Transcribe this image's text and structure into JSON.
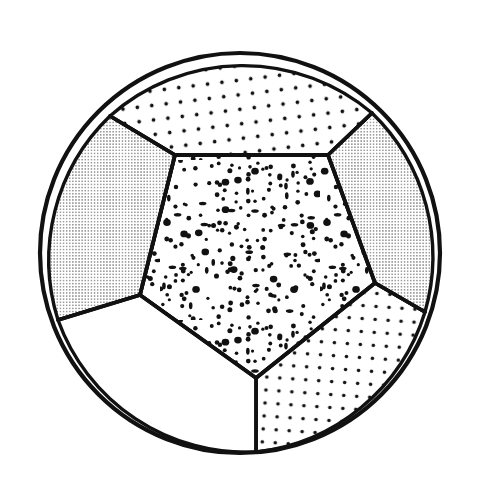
{
  "figure": {
    "kind": "line-drawing",
    "background_color": "#ffffff",
    "ink_color": "#111111",
    "canvas": {
      "width": 477,
      "height": 498
    }
  },
  "sphere": {
    "label": "sphere-outline",
    "center_x": 240,
    "center_y": 253,
    "radius": 200,
    "stroke_width": 4.2,
    "stroke_color": "#111111",
    "fill_color": "#ffffff"
  },
  "textures": [
    {
      "id": "fine-grid",
      "label": "fine dense dot grid",
      "dot_radius": 0.62,
      "spacing": 3.1,
      "rotation_deg": 0,
      "dot_color": "#1a1a1a"
    },
    {
      "id": "medium-grid-top",
      "label": "medium regular dot grid",
      "dot_radius": 1.85,
      "spacing": 14.5,
      "rotation_deg": -7,
      "dot_color": "#111111"
    },
    {
      "id": "medium-grid-bottom",
      "label": "medium regular dot grid",
      "dot_radius": 1.8,
      "spacing": 13.0,
      "rotation_deg": 4,
      "dot_color": "#111111"
    },
    {
      "id": "random-coarse",
      "label": "random scattered coarse stipple",
      "dot_radius": 2.0,
      "spacing": 8.0,
      "rotation_deg": 0,
      "dot_color": "#111111"
    },
    {
      "id": "blank",
      "label": "no stipple",
      "dot_radius": 0,
      "spacing": 0,
      "rotation_deg": 0,
      "dot_color": "none"
    }
  ],
  "faces": [
    {
      "id": "top-face",
      "name": "top hexagonal face",
      "texture": "medium-grid-top",
      "shading": "medium",
      "outline": "M 110,116 L 175,155 L 328,155 L 372,113 A 200,200 0 0 0 110,116 Z",
      "stroke_width": 3.4
    },
    {
      "id": "left-face",
      "name": "upper-left face",
      "texture": "fine-grid",
      "shading": "dense",
      "outline": "M 110,116 A 200,200 0 0 0 58,320 L 140,295 L 175,155 Z",
      "stroke_width": 3.4
    },
    {
      "id": "right-face",
      "name": "upper-right face",
      "texture": "fine-grid",
      "shading": "dense",
      "outline": "M 372,113 L 328,155 L 375,283 L 425,312 A 200,200 0 0 0 372,113 Z",
      "stroke_width": 3.4
    },
    {
      "id": "center-face",
      "name": "central pentagonal face",
      "texture": "random-coarse",
      "shading": "scattered",
      "outline": "M 175,155 L 328,155 L 375,283 L 256,378 L 140,295 Z",
      "stroke_width": 3.8
    },
    {
      "id": "bottom-right-face",
      "name": "lower-right face",
      "texture": "medium-grid-bottom",
      "shading": "medium",
      "outline": "M 375,283 L 425,312 A 200,200 0 0 1 256,452 L 256,378 Z",
      "stroke_width": 3.4
    },
    {
      "id": "bottom-left-face",
      "name": "lower-left blank face",
      "texture": "blank",
      "shading": "none",
      "outline": "M 58,320 L 140,295 L 256,378 L 256,452 A 200,200 0 0 1 58,320 Z",
      "stroke_width": 3.4
    }
  ],
  "edges": [
    {
      "id": "edge-top-left",
      "name": "edge between top and left face",
      "path": "M 110,116 L 175,155",
      "width": 3.6
    },
    {
      "id": "edge-top-center",
      "name": "edge between top and center face",
      "path": "M 175,155 L 328,155",
      "width": 3.6
    },
    {
      "id": "edge-top-right",
      "name": "edge between top and right face",
      "path": "M 328,155 L 372,113",
      "width": 3.6
    },
    {
      "id": "edge-left-center",
      "name": "edge between left and center face",
      "path": "M 175,155 L 140,295",
      "width": 3.6
    },
    {
      "id": "edge-left-bottomleft",
      "name": "edge between left and lower-left face",
      "path": "M 140,295 L 58,320",
      "width": 3.6
    },
    {
      "id": "edge-right-center",
      "name": "edge between right and center face",
      "path": "M 328,155 L 375,283",
      "width": 3.6
    },
    {
      "id": "edge-right-bottomright",
      "name": "edge between right and lower-right face",
      "path": "M 375,283 L 425,312",
      "width": 3.6
    },
    {
      "id": "edge-center-bottomleft",
      "name": "edge between center and lower-left face",
      "path": "M 140,295 L 256,378",
      "width": 3.6
    },
    {
      "id": "edge-center-bottomright",
      "name": "edge between center and lower-right face",
      "path": "M 375,283 L 256,378",
      "width": 3.6
    },
    {
      "id": "edge-bottom-vertical",
      "name": "edge between lower-left and lower-right face",
      "path": "M 256,378 L 256,452",
      "width": 3.6
    }
  ],
  "vertices": [
    {
      "id": "v-top-left-rim",
      "name": "top-left rim vertex",
      "x": 110,
      "y": 116
    },
    {
      "id": "v-top-right-rim",
      "name": "top-right rim vertex",
      "x": 372,
      "y": 113
    },
    {
      "id": "v-upper-left",
      "name": "upper-left interior vertex",
      "x": 175,
      "y": 155
    },
    {
      "id": "v-upper-right",
      "name": "upper-right interior vertex",
      "x": 328,
      "y": 155
    },
    {
      "id": "v-mid-left",
      "name": "mid-left interior vertex",
      "x": 140,
      "y": 295
    },
    {
      "id": "v-mid-right",
      "name": "mid-right interior vertex",
      "x": 375,
      "y": 283
    },
    {
      "id": "v-left-rim",
      "name": "left rim vertex",
      "x": 58,
      "y": 320
    },
    {
      "id": "v-right-rim",
      "name": "right rim vertex",
      "x": 425,
      "y": 312
    },
    {
      "id": "v-bottom-center",
      "name": "bottom center interior vertex",
      "x": 256,
      "y": 378
    },
    {
      "id": "v-bottom-rim",
      "name": "bottom rim vertex",
      "x": 256,
      "y": 452
    }
  ]
}
